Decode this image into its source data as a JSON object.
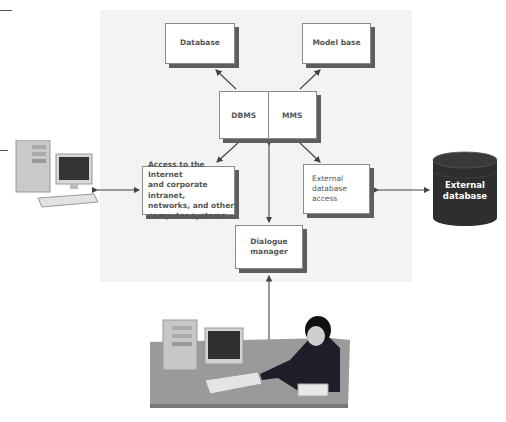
{
  "diagram": {
    "nodes": {
      "database": "Database",
      "model_base": "Model base",
      "dbms": "DBMS",
      "mms": "MMS",
      "internet_access": "Access to the Internet and corporate intranet, networks, and other computer systems",
      "internet_access_lines": [
        "Access to the Internet",
        "and corporate intranet,",
        "networks, and other",
        "computer systems"
      ],
      "external_access_lines": [
        "External",
        "database",
        "access"
      ],
      "dialogue_manager_lines": [
        "Dialogue",
        "manager"
      ],
      "external_database_lines": [
        "External",
        "database"
      ]
    },
    "edges": [
      {
        "from": "dbms",
        "to": "database",
        "arrow": "to"
      },
      {
        "from": "mms",
        "to": "model_base",
        "arrow": "to"
      },
      {
        "from": "dbms",
        "to": "internet_access",
        "arrow": "to"
      },
      {
        "from": "mms",
        "to": "external_access",
        "arrow": "to"
      },
      {
        "from": "dbms_mms",
        "to": "dialogue_manager",
        "arrow": "both"
      },
      {
        "from": "computer",
        "to": "internet_access",
        "arrow": "both"
      },
      {
        "from": "external_access",
        "to": "external_database",
        "arrow": "both"
      },
      {
        "from": "user",
        "to": "dialogue_manager",
        "arrow": "to"
      }
    ],
    "illustrations": [
      "desktop-computer",
      "user-at-workstation-on-phone"
    ],
    "colors": {
      "panel": "#f3f3f3",
      "box_border": "#8a8a8a",
      "shadow": "#5e5e5e",
      "text": "#555555",
      "cylinder": "#2e2e2e"
    }
  }
}
